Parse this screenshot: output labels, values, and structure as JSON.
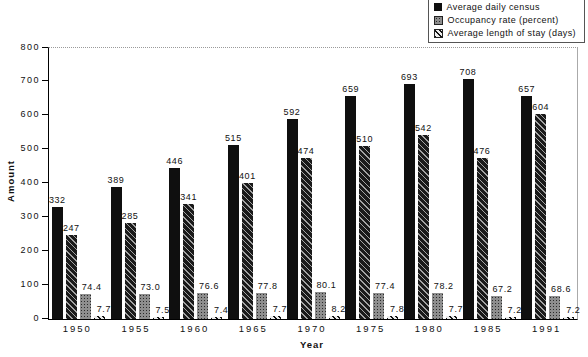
{
  "chart_data": {
    "type": "bar",
    "title": "",
    "xlabel": "Year",
    "ylabel": "Amount",
    "ylim": [
      0,
      800
    ],
    "yticks": [
      0,
      100,
      200,
      300,
      400,
      500,
      600,
      700,
      800
    ],
    "grid": "top-border-dotted-only",
    "categories": [
      "1950",
      "1955",
      "1960",
      "1965",
      "1970",
      "1975",
      "1980",
      "1985",
      "1991"
    ],
    "series": [
      {
        "name": "Average daily census",
        "swatch": "solid-black",
        "values": [
          332,
          389,
          446,
          515,
          592,
          659,
          693,
          708,
          657
        ],
        "labels": [
          "332",
          "389",
          "446",
          "515",
          "592",
          "659",
          "693",
          "708",
          "657"
        ]
      },
      {
        "name": "",
        "swatch": "dark-diagonal-hatch",
        "values": [
          247,
          285,
          341,
          401,
          474,
          510,
          542,
          476,
          604
        ],
        "labels": [
          "247",
          "285",
          "341",
          "401",
          "474",
          "510",
          "542",
          "476",
          "604"
        ]
      },
      {
        "name": "Occupancy rate (percent)",
        "swatch": "gray-dotted",
        "values": [
          74.4,
          73.0,
          76.6,
          77.8,
          80.1,
          77.4,
          78.2,
          67.2,
          68.6
        ],
        "labels": [
          "74.4",
          "73.0",
          "76.6",
          "77.8",
          "80.1",
          "77.4",
          "78.2",
          "67.2",
          "68.6"
        ]
      },
      {
        "name": "Average length of stay (days)",
        "swatch": "light-diagonal-hatch",
        "values": [
          7.7,
          7.5,
          7.4,
          7.7,
          8.2,
          7.8,
          7.7,
          7.2,
          7.2
        ],
        "labels": [
          "7.7",
          "7.5",
          "7.4",
          "7.7",
          "8.2",
          "7.8",
          "7.7",
          "7.2",
          "7.2"
        ]
      }
    ],
    "legend": {
      "position": "top-right",
      "entries": [
        {
          "label": "Average daily census",
          "swatch": "solid-black"
        },
        {
          "label": "Occupancy rate (percent)",
          "swatch": "gray-dotted"
        },
        {
          "label": "Average length of stay (days)",
          "swatch": "light-diagonal-hatch"
        }
      ]
    }
  }
}
